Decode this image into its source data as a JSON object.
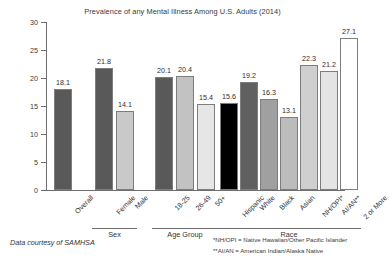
{
  "chart_data": {
    "type": "bar",
    "title": "Prevalence of any Mental Illness Among U.S. Adults (2014)",
    "xlabel": "",
    "ylabel": "Percent",
    "ylim": [
      0,
      30
    ],
    "yticks": [
      0,
      5,
      10,
      15,
      20,
      25,
      30
    ],
    "grid": false,
    "legend": "none",
    "categories": [
      "Overall",
      "Female",
      "Male",
      "18-25",
      "26-49",
      "50+",
      "Hispanic",
      "White",
      "Black",
      "Asian",
      "NH/OPI*",
      "AI/AN**",
      "2 or More"
    ],
    "values": [
      18.1,
      21.8,
      14.1,
      20.1,
      20.4,
      15.4,
      15.6,
      19.2,
      16.3,
      13.1,
      22.3,
      21.2,
      27.1
    ],
    "bars": [
      {
        "label": "Overall",
        "value": 18.1,
        "value_text": "18.1",
        "color": "#595959",
        "group": "Overall"
      },
      {
        "label": "Female",
        "value": 21.8,
        "value_text": "21.8",
        "color": "#595959",
        "group": "Sex"
      },
      {
        "label": "Male",
        "value": 14.1,
        "value_text": "14.1",
        "color": "#c9c9c9",
        "group": "Sex"
      },
      {
        "label": "18-25",
        "value": 20.1,
        "value_text": "20.1",
        "color": "#595959",
        "group": "Age Group"
      },
      {
        "label": "26-49",
        "value": 20.4,
        "value_text": "20.4",
        "color": "#c2c2c2",
        "group": "Age Group"
      },
      {
        "label": "50+",
        "value": 15.4,
        "value_text": "15.4",
        "color": "#e6e6e6",
        "group": "Age Group"
      },
      {
        "label": "Hispanic",
        "value": 15.6,
        "value_text": "15.6",
        "color": "#000000",
        "group": "Race"
      },
      {
        "label": "White",
        "value": 19.2,
        "value_text": "19.2",
        "color": "#606060",
        "group": "Race"
      },
      {
        "label": "Black",
        "value": 16.3,
        "value_text": "16.3",
        "color": "#a0a0a0",
        "group": "Race"
      },
      {
        "label": "Asian",
        "value": 13.1,
        "value_text": "13.1",
        "color": "#bcbcbc",
        "group": "Race"
      },
      {
        "label": "NH/OPI*",
        "value": 22.3,
        "value_text": "22.3",
        "color": "#cfcfcf",
        "group": "Race"
      },
      {
        "label": "AI/AN**",
        "value": 21.2,
        "value_text": "21.2",
        "color": "#e4e4e4",
        "group": "Race"
      },
      {
        "label": "2 or More",
        "value": 27.1,
        "value_text": "27.1",
        "color": "#ffffff",
        "group": "Race"
      }
    ],
    "groups": [
      {
        "label": "Sex",
        "first": 1,
        "last": 2
      },
      {
        "label": "Age Group",
        "first": 3,
        "last": 5
      },
      {
        "label": "Race",
        "first": 6,
        "last": 12
      }
    ]
  },
  "notes": {
    "source": "Data courtesy of SAMHSA",
    "footnotes": [
      "*NH/OPI = Native Hawaiian/Other Pacific Islander",
      "**AI/AN = American Indian/Alaska Native"
    ]
  }
}
